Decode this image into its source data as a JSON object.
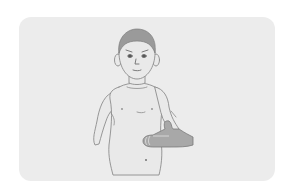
{
  "illustration": {
    "subject": "child-with-hand-on-abdomen",
    "alt_text": "Boy holding his hand on his stomach",
    "colors": {
      "background": "#ffffff",
      "card": "#ececec",
      "skin": "#e9e9e9",
      "outline": "#8c8c8c",
      "hair": "#9a9a9a",
      "hand": "#a8a8a8"
    }
  }
}
